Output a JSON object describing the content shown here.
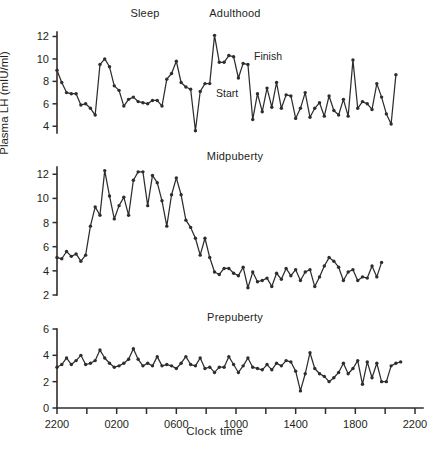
{
  "figure": {
    "xlabel": "Clock time",
    "ylabel": "Plasma LH (mIU/ml)",
    "xticks": [
      "2200",
      "0200",
      "0600",
      "1000",
      "1400",
      "1800",
      "2200"
    ],
    "annotations": {
      "sleep": "Sleep",
      "start": "Start",
      "finish": "Finish"
    }
  },
  "chart_data": [
    {
      "type": "line",
      "title": "Adulthood",
      "xlabel": "Clock time",
      "ylabel": "Plasma LH (mIU/ml)",
      "xlim": [
        2200,
        4600
      ],
      "ylim": [
        3.4,
        12.4
      ],
      "yticks": [
        4,
        6,
        8,
        10,
        12
      ],
      "xticks": [
        2200,
        2600,
        3000,
        3400,
        3800,
        4200,
        4600
      ],
      "xticklabels": [
        "2200",
        "0200",
        "0600",
        "1000",
        "1400",
        "1800",
        "2200"
      ],
      "grid": false,
      "legend": "none",
      "markers": true,
      "annotations": [
        {
          "text": "Sleep",
          "x": 2780,
          "y": 12.8
        },
        {
          "text": "Start",
          "x": 3340,
          "y": 6.8
        },
        {
          "text": "Finish",
          "x": 3480,
          "y": 9.5
        }
      ],
      "x": [
        2200,
        2232,
        2264,
        2296,
        2328,
        2360,
        2392,
        2424,
        2456,
        2488,
        2520,
        2552,
        2584,
        2616,
        2648,
        2680,
        2712,
        2744,
        2776,
        2808,
        2840,
        2872,
        2904,
        2936,
        2968,
        3000,
        3032,
        3064,
        3096,
        3128,
        3160,
        3192,
        3224,
        3256,
        3288,
        3320,
        3352,
        3384,
        3416,
        3448,
        3480,
        3512,
        3544,
        3576,
        3608,
        3640,
        3672,
        3704,
        3736,
        3768,
        3800,
        3832,
        3864,
        3896,
        3928,
        3960,
        3992,
        4024,
        4056,
        4088,
        4120,
        4152,
        4184,
        4216,
        4248,
        4280,
        4312,
        4344,
        4376,
        4408,
        4440,
        4472,
        4504,
        4536,
        4568
      ],
      "y": [
        9.0,
        7.9,
        7.0,
        6.9,
        6.9,
        5.9,
        6.0,
        5.6,
        5.0,
        9.5,
        10.0,
        9.3,
        7.6,
        7.2,
        5.8,
        6.4,
        6.6,
        6.2,
        6.1,
        6.0,
        6.3,
        6.3,
        5.8,
        8.2,
        8.7,
        9.8,
        7.9,
        7.5,
        7.3,
        3.6,
        7.1,
        7.8,
        7.8,
        12.1,
        9.7,
        9.7,
        10.3,
        10.2,
        8.3,
        9.6,
        9.5,
        4.6,
        6.9,
        5.3,
        7.4,
        5.7,
        7.9,
        5.6,
        6.8,
        6.7,
        4.7,
        5.6,
        7.0,
        4.8,
        5.6,
        6.1,
        4.9,
        6.7,
        5.4,
        5.0,
        6.4,
        4.9,
        9.9,
        5.6,
        6.2,
        6.0,
        5.5,
        7.8,
        6.6,
        5.1,
        4.2,
        8.6
      ]
    },
    {
      "type": "line",
      "title": "Midpuberty",
      "xlabel": "Clock time",
      "ylabel": "Plasma LH (mIU/ml)",
      "xlim": [
        2200,
        4600
      ],
      "ylim": [
        2.0,
        12.6
      ],
      "yticks": [
        2,
        4,
        6,
        8,
        10,
        12
      ],
      "xticks": [
        2200,
        2600,
        3000,
        3400,
        3800,
        4200,
        4600
      ],
      "xticklabels": [
        "2200",
        "0200",
        "0600",
        "1000",
        "1400",
        "1800",
        "2200"
      ],
      "grid": false,
      "legend": "none",
      "markers": true,
      "x": [
        2200,
        2232,
        2264,
        2296,
        2328,
        2360,
        2392,
        2424,
        2456,
        2488,
        2520,
        2552,
        2584,
        2616,
        2648,
        2680,
        2712,
        2744,
        2776,
        2808,
        2840,
        2872,
        2904,
        2936,
        2968,
        3000,
        3032,
        3064,
        3096,
        3128,
        3160,
        3192,
        3224,
        3256,
        3288,
        3320,
        3352,
        3384,
        3416,
        3448,
        3480,
        3512,
        3544,
        3576,
        3608,
        3640,
        3672,
        3704,
        3736,
        3768,
        3800,
        3832,
        3864,
        3896,
        3928,
        3960,
        3992,
        4024,
        4056,
        4088,
        4120,
        4152,
        4184,
        4216,
        4248,
        4280,
        4312,
        4344,
        4376,
        4408,
        4440,
        4472,
        4504,
        4536
      ],
      "y": [
        5.1,
        5.0,
        5.6,
        5.2,
        5.4,
        4.8,
        5.3,
        7.7,
        9.3,
        8.6,
        12.3,
        10.2,
        8.3,
        9.4,
        10.1,
        8.6,
        11.5,
        12.2,
        12.2,
        9.4,
        11.9,
        11.3,
        9.8,
        7.7,
        10.3,
        11.7,
        10.3,
        8.2,
        7.6,
        6.7,
        5.3,
        6.7,
        5.1,
        3.9,
        3.7,
        4.2,
        4.2,
        3.8,
        3.6,
        4.3,
        2.6,
        3.9,
        3.1,
        3.2,
        3.4,
        2.7,
        3.8,
        3.3,
        4.2,
        3.6,
        4.1,
        3.2,
        3.9,
        4.1,
        2.7,
        3.5,
        4.4,
        5.1,
        4.8,
        4.3,
        3.2,
        3.9,
        4.1,
        3.2,
        3.5,
        3.4,
        4.4,
        3.5,
        4.7
      ]
    },
    {
      "type": "line",
      "title": "Prepuberty",
      "xlabel": "Clock time",
      "ylabel": "Plasma LH (mIU/ml)",
      "xlim": [
        2200,
        4600
      ],
      "ylim": [
        0,
        6
      ],
      "yticks": [
        0,
        2,
        4,
        6
      ],
      "xticks": [
        2200,
        2600,
        3000,
        3400,
        3800,
        4200,
        4600
      ],
      "xticklabels": [
        "2200",
        "0200",
        "0600",
        "1000",
        "1400",
        "1800",
        "2200"
      ],
      "grid": false,
      "legend": "none",
      "markers": true,
      "x": [
        2200,
        2232,
        2264,
        2296,
        2328,
        2360,
        2392,
        2424,
        2456,
        2488,
        2520,
        2552,
        2584,
        2616,
        2648,
        2680,
        2712,
        2744,
        2776,
        2808,
        2840,
        2872,
        2904,
        2936,
        2968,
        3000,
        3032,
        3064,
        3096,
        3128,
        3160,
        3192,
        3224,
        3256,
        3288,
        3320,
        3352,
        3384,
        3416,
        3448,
        3480,
        3512,
        3544,
        3576,
        3608,
        3640,
        3672,
        3704,
        3736,
        3768,
        3800,
        3832,
        3864,
        3896,
        3928,
        3960,
        3992,
        4024,
        4056,
        4088,
        4120,
        4152,
        4184,
        4216,
        4248,
        4280,
        4312,
        4344,
        4376,
        4408,
        4440,
        4472,
        4504,
        4536
      ],
      "y": [
        3.1,
        3.3,
        3.8,
        3.3,
        3.6,
        4.0,
        3.3,
        3.4,
        3.6,
        4.4,
        3.8,
        3.4,
        3.1,
        3.2,
        3.4,
        3.7,
        4.5,
        3.7,
        3.2,
        3.4,
        3.2,
        3.9,
        3.2,
        3.3,
        3.2,
        3.0,
        3.4,
        3.9,
        3.3,
        3.2,
        3.8,
        3.0,
        3.1,
        2.7,
        3.1,
        3.1,
        3.9,
        3.3,
        2.7,
        3.2,
        3.8,
        3.1,
        3.0,
        2.9,
        3.3,
        2.9,
        3.4,
        3.2,
        3.6,
        3.5,
        2.8,
        1.3,
        2.6,
        4.2,
        3.0,
        2.6,
        2.4,
        2.0,
        2.3,
        2.7,
        3.4,
        2.6,
        3.0,
        3.6,
        1.8,
        3.5,
        2.3,
        3.4,
        2.0,
        2.0,
        3.2,
        3.4,
        3.5
      ]
    }
  ]
}
